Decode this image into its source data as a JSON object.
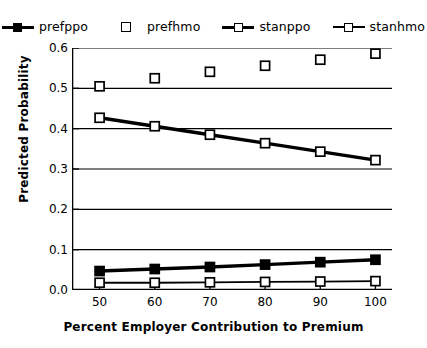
{
  "chart_data": {
    "type": "line",
    "title": "",
    "xlabel": "Percent Employer Contribution to Premium",
    "ylabel": "Predicted Probability",
    "x": [
      50,
      60,
      70,
      80,
      90,
      100
    ],
    "xlim": [
      45,
      103
    ],
    "ylim": [
      0.0,
      0.6
    ],
    "xticks": [
      "50",
      "60",
      "70",
      "80",
      "90",
      "100"
    ],
    "yticks": [
      "0.0",
      "0.1",
      "0.2",
      "0.3",
      "0.4",
      "0.5",
      "0.6"
    ],
    "grid": "horizontal",
    "legend_position": "top-center",
    "series": [
      {
        "name": "prefppo",
        "values": [
          0.047,
          0.052,
          0.057,
          0.063,
          0.069,
          0.075
        ],
        "marker": "filled-square",
        "line": "thick-solid",
        "color": "#000000"
      },
      {
        "name": "prefhmo",
        "values": [
          0.505,
          0.525,
          0.541,
          0.556,
          0.571,
          0.586
        ],
        "marker": "open-square",
        "line": "none",
        "color": "#000000"
      },
      {
        "name": "stanppo",
        "values": [
          0.427,
          0.406,
          0.385,
          0.364,
          0.343,
          0.322
        ],
        "marker": "open-square",
        "line": "thick-solid",
        "color": "#000000"
      },
      {
        "name": "stanhmo",
        "values": [
          0.018,
          0.018,
          0.019,
          0.02,
          0.021,
          0.022
        ],
        "marker": "open-square",
        "line": "thin-solid",
        "color": "#000000"
      }
    ]
  },
  "legend": {
    "entries": [
      {
        "label": "prefppo"
      },
      {
        "label": "prefhmo"
      },
      {
        "label": "stanppo"
      },
      {
        "label": "stanhmo"
      }
    ]
  },
  "axes": {
    "y_title": "Predicted Probability",
    "x_title": "Percent Employer Contribution to Premium",
    "y_labels": [
      "0.6",
      "0.5",
      "0.4",
      "0.3",
      "0.2",
      "0.1",
      "0.0"
    ],
    "x_labels": [
      "50",
      "60",
      "70",
      "80",
      "90",
      "100"
    ]
  }
}
